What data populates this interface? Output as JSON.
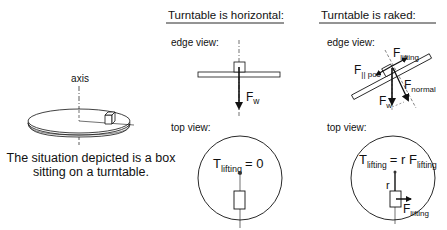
{
  "left_panel": {
    "axis_label": "axis",
    "caption_line1": "The situation depicted is a box",
    "caption_line2": "sitting on a turntable."
  },
  "horizontal_panel": {
    "heading": "Turntable is horizontal:",
    "edge_view_label": "edge view:",
    "weight_force": {
      "symbol": "F",
      "subscript": "w"
    },
    "top_view_label": "top view:",
    "torque_eq": {
      "symbol": "T",
      "subscript": "lifting",
      "rhs": "= 0"
    }
  },
  "raked_panel": {
    "heading": "Turntable is raked:",
    "edge_view_label": "edge view:",
    "forces": [
      {
        "symbol": "F",
        "subscript": "lifting"
      },
      {
        "symbol": "F",
        "subscript": "|| poc"
      },
      {
        "symbol": "F",
        "subscript": "normal"
      },
      {
        "symbol": "F",
        "subscript": "w"
      }
    ],
    "top_view_label": "top view:",
    "torque_eq": {
      "symbol": "T",
      "subscript": "lifting",
      "rhs": "= r F",
      "rhs_subscript": "lifting"
    },
    "radius_label": "r",
    "lifting_force": {
      "symbol": "F",
      "subscript": "lifting"
    }
  },
  "colors": {
    "ink": "#111111",
    "turntable_fill": "#ffffff",
    "dashed": "#333333"
  }
}
